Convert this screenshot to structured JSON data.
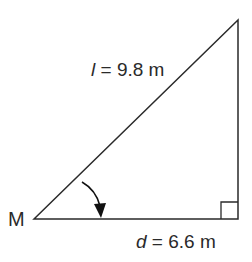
{
  "diagram": {
    "type": "right-triangle",
    "vertex_label": "M",
    "hypotenuse": {
      "var": "l",
      "eq": " = 9.8 m",
      "value": 9.8,
      "unit": "m"
    },
    "base": {
      "var": "d",
      "eq": " = 6.6 m",
      "value": 6.6,
      "unit": "m"
    },
    "right_angle_marker": true,
    "angle_arrow_at": "M",
    "colors": {
      "stroke": "#2a2a2a",
      "background": "#ffffff"
    }
  }
}
